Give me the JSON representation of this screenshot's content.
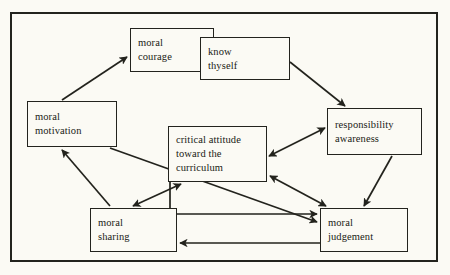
{
  "diagram": {
    "type": "flow-diagram",
    "background_color": "#fbfaf4",
    "line_color": "#23231d",
    "frame": {
      "x": 10,
      "y": 12,
      "width": 428,
      "height": 250
    },
    "nodes": [
      {
        "id": "moral-courage",
        "line1": "moral",
        "line2": "courage",
        "x": 130,
        "y": 28,
        "width": 84,
        "height": 44
      },
      {
        "id": "know-thyself",
        "line1": "know",
        "line2": "thyself",
        "x": 200,
        "y": 37,
        "width": 90,
        "height": 43
      },
      {
        "id": "moral-motivation",
        "line1": "moral",
        "line2": "motivation",
        "x": 27,
        "y": 101,
        "width": 90,
        "height": 46
      },
      {
        "id": "critical-attitude",
        "line1": "critical attitude",
        "line2": "toward the",
        "line3": "curriculum",
        "x": 168,
        "y": 126,
        "width": 99,
        "height": 56
      },
      {
        "id": "responsibility-awareness",
        "line1": "responsibility",
        "line2": "awareness",
        "x": 327,
        "y": 108,
        "width": 95,
        "height": 47
      },
      {
        "id": "moral-sharing",
        "line1": "moral",
        "line2": "sharing",
        "x": 90,
        "y": 208,
        "width": 87,
        "height": 44
      },
      {
        "id": "moral-judgement",
        "line1": "moral",
        "line2": "judgement",
        "x": 320,
        "y": 208,
        "width": 88,
        "height": 44
      }
    ],
    "edges": [
      {
        "id": "motivation-to-courage",
        "from": "moral-motivation",
        "to": "moral-courage",
        "arrows": "single"
      },
      {
        "id": "thyself-to-responsibility",
        "from": "know-thyself",
        "to": "responsibility-awareness",
        "arrows": "single"
      },
      {
        "id": "responsibility-critical",
        "from": "responsibility-awareness",
        "to": "critical-attitude",
        "arrows": "double"
      },
      {
        "id": "responsibility-to-judgement",
        "from": "responsibility-awareness",
        "to": "moral-judgement",
        "arrows": "single"
      },
      {
        "id": "motivation-to-judgement",
        "from": "moral-motivation",
        "to": "moral-judgement",
        "arrows": "single"
      },
      {
        "id": "sharing-critical",
        "from": "moral-sharing",
        "to": "critical-attitude",
        "arrows": "double"
      },
      {
        "id": "sharing-to-motivation",
        "from": "moral-sharing",
        "to": "moral-motivation",
        "arrows": "single"
      },
      {
        "id": "critical-to-judgement-elbow",
        "from": "critical-attitude",
        "to": "moral-judgement",
        "arrows": "single"
      },
      {
        "id": "critical-judgement-diagonal",
        "from": "critical-attitude",
        "to": "moral-judgement",
        "arrows": "double"
      },
      {
        "id": "judgement-to-sharing",
        "from": "moral-judgement",
        "to": "moral-sharing",
        "arrows": "single"
      }
    ]
  }
}
